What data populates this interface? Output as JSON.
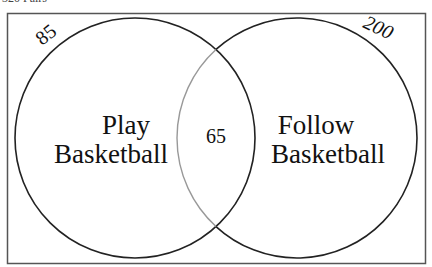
{
  "caption_partial": "320 Pairs",
  "diagram": {
    "type": "venn",
    "sets": [
      {
        "label_line1": "Play",
        "label_line2": "Basketball",
        "total": "85"
      },
      {
        "label_line1": "Follow",
        "label_line2": "Basketball",
        "total": "200"
      }
    ],
    "intersection": "65",
    "colors": {
      "outline": "#222222",
      "inner_arc": "#999999",
      "frame": "#555555"
    }
  }
}
